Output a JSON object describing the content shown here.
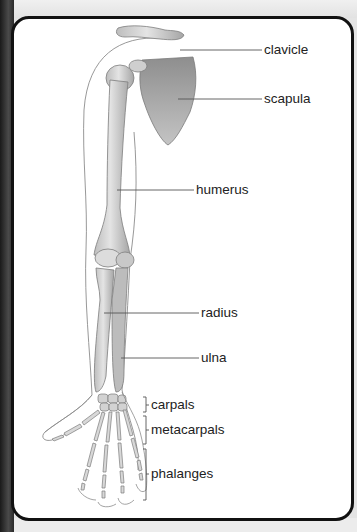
{
  "diagram": {
    "labels": {
      "clavicle": "clavicle",
      "scapula": "scapula",
      "humerus": "humerus",
      "radius": "radius",
      "ulna": "ulna",
      "carpals": "carpals",
      "metacarpals": "metacarpals",
      "phalanges": "phalanges"
    },
    "colors": {
      "bone": "#c9c9c9",
      "bone_shade": "#9a9a9a",
      "scapula": "#a8a8a8",
      "outline": "#8a8a8a",
      "leader_line": "#555555",
      "card_border": "#111111"
    }
  }
}
